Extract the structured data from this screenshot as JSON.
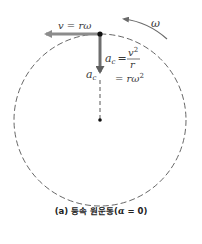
{
  "diagram": {
    "labels": {
      "velocity": "v = rω",
      "omega": "ω",
      "ac_lhs": "a",
      "ac_sub": "c",
      "ac_eq": "=",
      "frac_num_base": "v",
      "frac_num_exp": "2",
      "frac_den": "r",
      "second_eq": "= rω",
      "second_eq_exp": "2",
      "ac_arrow_label": "a",
      "ac_arrow_sub": "c"
    },
    "caption": {
      "prefix": "(a) 등속 원운동(",
      "alpha": "α",
      "suffix": " = 0)"
    },
    "colors": {
      "arrow": "#8c8c8c",
      "ac_arrow": "#6e6e6e",
      "circle": "#555555",
      "dot": "#111111"
    }
  }
}
